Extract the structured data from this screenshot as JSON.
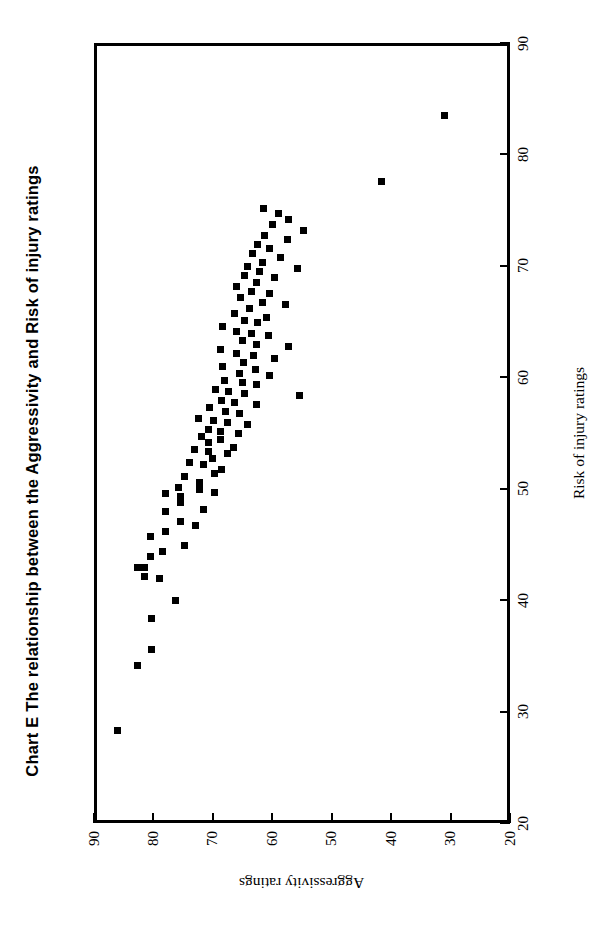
{
  "chart_data": {
    "type": "scatter",
    "title": "Chart E  The relationship between the Aggressivity and Risk of injury ratings",
    "title_prefix": "Chart E",
    "xlabel": "Risk of injury ratings",
    "ylabel": "Aggressivity ratings",
    "xlim": [
      20,
      90
    ],
    "ylim": [
      20,
      90
    ],
    "xticks": [
      20,
      30,
      40,
      50,
      60,
      70,
      80,
      90
    ],
    "yticks": [
      20,
      30,
      40,
      50,
      60,
      70,
      80,
      90
    ],
    "grid": false,
    "legend": null,
    "marker": "square",
    "marker_color": "#000000",
    "orientation_note": "figure is printed rotated 90 degrees; x-axis ticks appear along the right edge, y-axis ticks along the bottom edge",
    "points": [
      [
        28.6,
        86.6
      ],
      [
        34.4,
        83.2
      ],
      [
        35.8,
        80.9
      ],
      [
        38.6,
        80.9
      ],
      [
        40.2,
        76.8
      ],
      [
        42.2,
        79.4
      ],
      [
        42.4,
        82.0
      ],
      [
        43.2,
        82.0
      ],
      [
        43.2,
        83.2
      ],
      [
        44.2,
        81.0
      ],
      [
        44.6,
        78.9
      ],
      [
        45.2,
        75.2
      ],
      [
        46.0,
        81.0
      ],
      [
        46.4,
        78.4
      ],
      [
        47.0,
        73.4
      ],
      [
        47.3,
        75.9
      ],
      [
        48.2,
        78.4
      ],
      [
        48.4,
        72.1
      ],
      [
        49.0,
        75.9
      ],
      [
        49.6,
        75.9
      ],
      [
        49.8,
        78.4
      ],
      [
        49.9,
        70.2
      ],
      [
        50.2,
        72.8
      ],
      [
        50.4,
        76.3
      ],
      [
        50.8,
        72.8
      ],
      [
        51.4,
        75.2
      ],
      [
        51.6,
        70.2
      ],
      [
        52.0,
        69.0
      ],
      [
        52.4,
        72.1
      ],
      [
        52.6,
        74.4
      ],
      [
        53.0,
        70.6
      ],
      [
        53.4,
        68.0
      ],
      [
        53.6,
        71.2
      ],
      [
        53.8,
        73.6
      ],
      [
        54.0,
        67.0
      ],
      [
        54.4,
        71.2
      ],
      [
        54.7,
        69.2
      ],
      [
        55.0,
        72.5
      ],
      [
        55.2,
        66.2
      ],
      [
        55.4,
        69.2
      ],
      [
        55.6,
        71.2
      ],
      [
        56.0,
        64.6
      ],
      [
        56.2,
        68.0
      ],
      [
        56.4,
        70.4
      ],
      [
        56.6,
        73.0
      ],
      [
        57.0,
        66.0
      ],
      [
        57.2,
        68.4
      ],
      [
        57.6,
        71.0
      ],
      [
        57.8,
        63.2
      ],
      [
        58.0,
        66.8
      ],
      [
        58.2,
        69.0
      ],
      [
        58.6,
        55.9
      ],
      [
        58.8,
        65.2
      ],
      [
        59.0,
        67.8
      ],
      [
        59.2,
        70.1
      ],
      [
        59.6,
        63.2
      ],
      [
        59.8,
        65.6
      ],
      [
        60.0,
        68.5
      ],
      [
        60.4,
        61.0
      ],
      [
        60.6,
        66.0
      ],
      [
        61.0,
        63.4
      ],
      [
        61.2,
        68.8
      ],
      [
        61.6,
        65.4
      ],
      [
        62.0,
        60.2
      ],
      [
        62.2,
        63.6
      ],
      [
        62.4,
        66.5
      ],
      [
        62.8,
        69.2
      ],
      [
        63.0,
        57.8
      ],
      [
        63.2,
        63.2
      ],
      [
        63.6,
        65.6
      ],
      [
        64.0,
        61.2
      ],
      [
        64.2,
        64.0
      ],
      [
        64.4,
        66.6
      ],
      [
        64.8,
        68.8
      ],
      [
        65.2,
        63.0
      ],
      [
        65.4,
        65.2
      ],
      [
        65.6,
        61.4
      ],
      [
        66.0,
        66.8
      ],
      [
        66.4,
        64.4
      ],
      [
        66.8,
        58.2
      ],
      [
        67.0,
        62.2
      ],
      [
        67.4,
        65.8
      ],
      [
        67.8,
        61.0
      ],
      [
        68.0,
        64.0
      ],
      [
        68.4,
        66.6
      ],
      [
        68.8,
        63.2
      ],
      [
        69.2,
        60.2
      ],
      [
        69.4,
        65.2
      ],
      [
        69.8,
        62.6
      ],
      [
        70.0,
        56.3
      ],
      [
        70.2,
        64.6
      ],
      [
        70.6,
        62.2
      ],
      [
        71.0,
        59.2
      ],
      [
        71.4,
        63.8
      ],
      [
        71.8,
        61.0
      ],
      [
        72.2,
        63.0
      ],
      [
        72.6,
        58.0
      ],
      [
        73.0,
        61.8
      ],
      [
        73.4,
        55.2
      ],
      [
        74.0,
        60.4
      ],
      [
        74.4,
        57.8
      ],
      [
        75.0,
        59.4
      ],
      [
        75.4,
        62.0
      ],
      [
        77.8,
        42.1
      ],
      [
        83.8,
        31.5
      ]
    ]
  }
}
